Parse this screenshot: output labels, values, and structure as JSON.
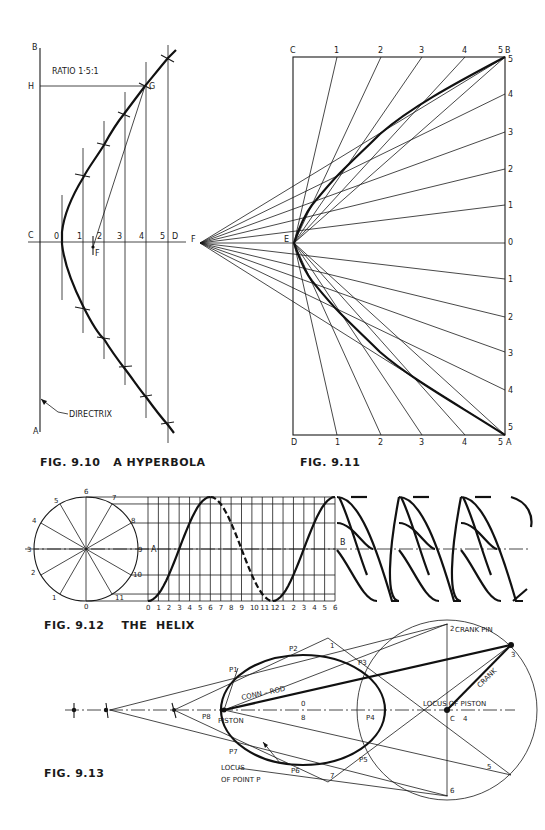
{
  "figures": {
    "fig_9_10": {
      "caption": "FIG. 9.10   A HYPERBOLA",
      "ratio_label": "RATIO 1·5:1",
      "points": {
        "B": "B",
        "H": "H",
        "G": "G",
        "C": "C",
        "D": "D",
        "F": "F",
        "A": "A"
      },
      "column_labels": [
        "0",
        "1",
        "2",
        "3",
        "4",
        "5"
      ],
      "directrix_label": "DIRECTRIX"
    },
    "fig_9_11": {
      "caption": "FIG. 9.11",
      "corners": {
        "C": "C",
        "B": "B",
        "D": "D",
        "A": "A",
        "E": "E",
        "F": "F"
      },
      "top_labels": [
        "1",
        "2",
        "3",
        "4",
        "5"
      ],
      "bottom_labels": [
        "1",
        "2",
        "3",
        "4",
        "5"
      ],
      "right_labels_upper": [
        "5",
        "4",
        "3",
        "2",
        "1",
        "0"
      ],
      "right_labels_lower": [
        "1",
        "2",
        "3",
        "4",
        "5"
      ]
    },
    "fig_9_12": {
      "caption": "FIG. 9.12    THE  HELIX",
      "circle_labels": [
        "0",
        "1",
        "2",
        "3",
        "4",
        "5",
        "6",
        "7",
        "8",
        "9",
        "10",
        "11"
      ],
      "axis_labels": [
        "0",
        "1",
        "2",
        "3",
        "4",
        "5",
        "6",
        "7",
        "8",
        "9",
        "10",
        "11",
        "12",
        "1",
        "2",
        "3",
        "4",
        "5",
        "6"
      ],
      "point_A": "A",
      "point_B": "B"
    },
    "fig_9_13": {
      "caption": "FIG. 9.13",
      "labels": {
        "crank_pin": "CRANK PIN",
        "crank": "CRANK",
        "conn_rod": "CONN – ROD",
        "locus_of_piston": "LOCUS OF PISTON",
        "piston": "PISTON",
        "locus_of_point_p_line1": "LOCUS",
        "locus_of_point_p_line2": "OF POINT P",
        "C": "C"
      },
      "p_labels": [
        "P1",
        "P2",
        "P3",
        "P4",
        "P5",
        "P6",
        "P7",
        "P8"
      ],
      "crank_circle_labels": [
        "0",
        "8",
        "1",
        "2",
        "3",
        "4",
        "5",
        "6",
        "7"
      ]
    }
  }
}
